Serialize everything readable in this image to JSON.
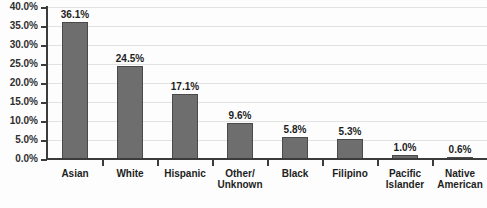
{
  "chart_data": {
    "type": "bar",
    "title": "",
    "xlabel": "",
    "ylabel": "",
    "categories": [
      "Asian",
      "White",
      "Hispanic",
      "Other/ Unknown",
      "Black",
      "Filipino",
      "Pacific Islander",
      "Native American"
    ],
    "category_lines": [
      [
        "Asian"
      ],
      [
        "White"
      ],
      [
        "Hispanic"
      ],
      [
        "Other/",
        "Unknown"
      ],
      [
        "Black"
      ],
      [
        "Filipino"
      ],
      [
        "Pacific",
        "Islander"
      ],
      [
        "Native",
        "American"
      ]
    ],
    "values": [
      36.1,
      24.5,
      17.1,
      9.6,
      5.8,
      5.3,
      1.0,
      0.6
    ],
    "value_labels": [
      "36.1%",
      "24.5%",
      "17.1%",
      "9.6%",
      "5.8%",
      "5.3%",
      "1.0%",
      "0.6%"
    ],
    "ylim": [
      0,
      40
    ],
    "ytick_values": [
      0,
      5,
      10,
      15,
      20,
      25,
      30,
      35,
      40
    ],
    "ytick_labels": [
      "0.0%",
      "5.0%",
      "10.0%",
      "15.0%",
      "20.0%",
      "25.0%",
      "30.0%",
      "35.0%",
      "40.0%"
    ],
    "grid": true,
    "legend": false,
    "legend_position": "none",
    "bar_color": "#6e6e6e",
    "bar_border_color": "#4a4a4a",
    "gridline_color": "#e2e2e2",
    "axis_color": "#3b3b3b",
    "background_color": "#fdfdfd"
  }
}
